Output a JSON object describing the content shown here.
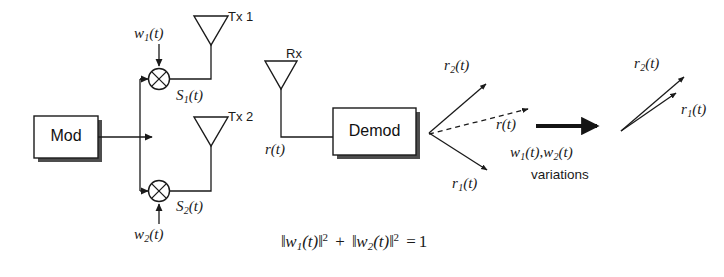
{
  "figure": {
    "type": "block-diagram"
  },
  "transmitter": {
    "mod_block_label": "Mod",
    "weight1_label": "w1(t)",
    "weight2_label": "w2(t)",
    "signal1_label": "S1(t)",
    "signal2_label": "S2(t)",
    "antenna1_label": "Tx 1",
    "antenna2_label": "Tx 2",
    "multiplier_glyph": "⊗"
  },
  "receiver": {
    "antenna_label": "Rx",
    "received_label": "r(t)",
    "demod_block_label": "Demod"
  },
  "vector_diagram_left": {
    "vector_top_label": "r2(t)",
    "vector_bottom_label": "r1(t)",
    "vector_resultant_label": "r(t)"
  },
  "transition": {
    "arrow_name": "variations-arrow",
    "weights_label": "w1(t), w2(t)",
    "caption": "variations"
  },
  "vector_diagram_right": {
    "vector_top_label": "r2(t)",
    "vector_bottom_label": "r1(t)"
  },
  "constraint_equation": {
    "text": "||w1(t)||^2 + ||w2(t)||^2 = 1",
    "parts": {
      "norm_open": "‖",
      "w": "w",
      "sub1": "1",
      "sub2": "2",
      "of_t": "(t)",
      "norm_close": "‖",
      "power": "2",
      "plus": "+",
      "equals": "=",
      "one": "1"
    }
  },
  "style": {
    "line_color": "#1a1a1a",
    "shadow_color": "#4d4d4d",
    "background": "#ffffff"
  }
}
